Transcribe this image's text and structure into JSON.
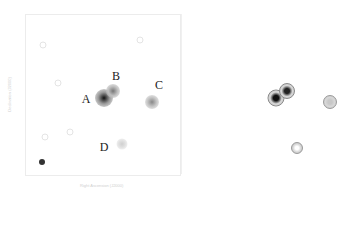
{
  "figure": {
    "left_panel": {
      "description": "grayscale smoothed X-ray/optical map with labeled sources",
      "sources": [
        {
          "label": "A",
          "x": 104,
          "y": 98,
          "size": 18,
          "core": "#111111",
          "halo": "#9a9a9a",
          "label_x": 86,
          "label_y": 99
        },
        {
          "label": "B",
          "x": 113,
          "y": 91,
          "size": 14,
          "core": "#777777",
          "halo": "#bdbdbd",
          "label_x": 116,
          "label_y": 76
        },
        {
          "label": "C",
          "x": 152,
          "y": 102,
          "size": 14,
          "core": "#888888",
          "halo": "#c4c4c4",
          "label_x": 159,
          "label_y": 85
        },
        {
          "label": "D",
          "x": 122,
          "y": 144,
          "size": 11,
          "core": "#cfcfcf",
          "halo": "#e2e2e2",
          "label_x": 104,
          "label_y": 147
        }
      ],
      "beam_marker": {
        "x": 42,
        "y": 162,
        "size": 6,
        "color": "#333333"
      },
      "x_axis_label": "Right Ascension (J2000)",
      "y_axis_label": "Declination (J2000)"
    },
    "right_panel": {
      "description": "model/contour rendering of the same sources",
      "sources": [
        {
          "name": "A",
          "x": 276,
          "y": 98,
          "size": 15,
          "core": "#111111",
          "ring": "#8a8a8a"
        },
        {
          "name": "B",
          "x": 287,
          "y": 91,
          "size": 14,
          "core": "#222222",
          "ring": "#8a8a8a"
        },
        {
          "name": "C",
          "x": 330,
          "y": 102,
          "size": 12,
          "core": "#c8c8c8",
          "ring": "#999999"
        },
        {
          "name": "D",
          "x": 297,
          "y": 148,
          "size": 10,
          "core": "#ffffff",
          "ring": "#999999"
        }
      ]
    }
  }
}
